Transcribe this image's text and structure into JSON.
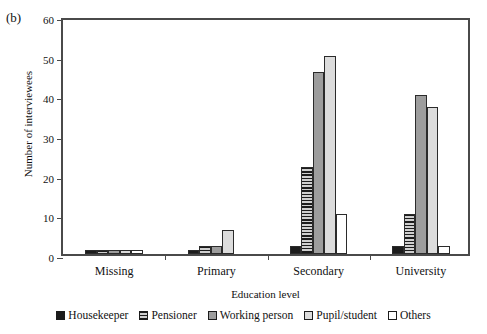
{
  "figure": {
    "panel_label": "(b)"
  },
  "chart_data": {
    "type": "bar",
    "title": "",
    "subtitle": "",
    "xlabel": "Education level",
    "ylabel": "Number of interviewees",
    "categories": [
      "Missing",
      "Primary",
      "Secondary",
      "University"
    ],
    "yticks": [
      0,
      10,
      20,
      30,
      40,
      50,
      60
    ],
    "ylim": [
      0,
      60
    ],
    "grid": false,
    "legend_position": "bottom",
    "series": [
      {
        "name": "Housekeeper",
        "fill": "solid-black",
        "color": "#1c1c1c",
        "values": [
          1,
          1,
          2,
          2
        ]
      },
      {
        "name": "Pensioner",
        "fill": "horizontal-stripes",
        "color": "#8e8e8e",
        "values": [
          1,
          2,
          22,
          10
        ]
      },
      {
        "name": "Working person",
        "fill": "dark-gray",
        "color": "#9d9d9d",
        "values": [
          1,
          2,
          46,
          40
        ]
      },
      {
        "name": "Pupil/student",
        "fill": "light-gray",
        "color": "#dcdcdc",
        "values": [
          1,
          6,
          50,
          37
        ]
      },
      {
        "name": "Others",
        "fill": "white",
        "color": "#ffffff",
        "values": [
          1,
          0,
          10,
          2
        ]
      }
    ]
  }
}
